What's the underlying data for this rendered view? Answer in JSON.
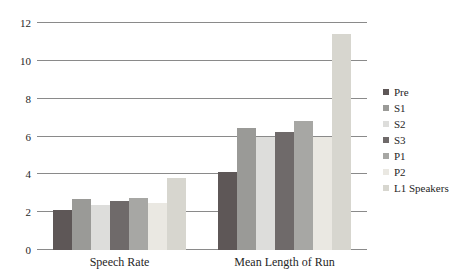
{
  "chart_data": {
    "type": "bar",
    "title": "",
    "categories": [
      "Speech Rate",
      "Mean Length of Run"
    ],
    "series": [
      {
        "name": "Pre",
        "color": "#5e5757",
        "values": [
          2.1,
          4.1
        ]
      },
      {
        "name": "S1",
        "color": "#9a9a97",
        "values": [
          2.7,
          6.45
        ]
      },
      {
        "name": "S2",
        "color": "#dddddb",
        "values": [
          2.4,
          6.0
        ]
      },
      {
        "name": "S3",
        "color": "#6f6a6a",
        "values": [
          2.6,
          6.25
        ]
      },
      {
        "name": "P1",
        "color": "#a7a7a4",
        "values": [
          2.75,
          6.8
        ]
      },
      {
        "name": "P2",
        "color": "#eae8e2",
        "values": [
          2.5,
          6.0
        ]
      },
      {
        "name": "L1 Speakers",
        "color": "#d7d6cf",
        "values": [
          3.8,
          11.4
        ]
      }
    ],
    "ylim": [
      0,
      12
    ],
    "yticks": [
      0,
      2,
      4,
      6,
      8,
      10,
      12
    ],
    "grid": true,
    "grid_color": "#8a8a8a",
    "legend_position": "right",
    "xlabel": "",
    "ylabel": ""
  }
}
